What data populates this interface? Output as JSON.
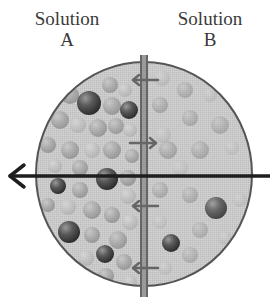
{
  "labels": {
    "solution_a": {
      "line1": "Solution",
      "line2": "A"
    },
    "solution_b": {
      "line1": "Solution",
      "line2": "B"
    }
  },
  "diagram": {
    "type": "osmosis-membrane",
    "container": {
      "shape": "circle",
      "cx": 144,
      "cy": 174,
      "rx": 108,
      "ry": 112,
      "fill_left": "#c4c4c4",
      "fill_right": "#cdcdcd",
      "stroke": "#555555"
    },
    "membrane": {
      "x": 144,
      "y_top": 55,
      "y_bottom": 297,
      "color": "#6a6a6a"
    },
    "main_arrow": {
      "direction": "left",
      "y": 176,
      "x_start": 270,
      "x_end": 8,
      "color": "#222222"
    },
    "membrane_arrows": [
      {
        "y": 80,
        "direction": "left"
      },
      {
        "y": 143,
        "direction": "right"
      },
      {
        "y": 206,
        "direction": "left"
      },
      {
        "y": 268,
        "direction": "left"
      }
    ],
    "colors": {
      "dark_sphere": "#4a4a4a",
      "light_sphere": "#a8a8a8",
      "background": "#ffffff"
    }
  }
}
